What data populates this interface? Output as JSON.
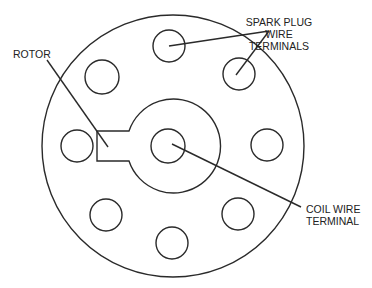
{
  "diagram": {
    "labels": {
      "rotor": "ROTOR",
      "spark_plug_line1": "SPARK PLUG",
      "spark_plug_line2": "WIRE",
      "spark_plug_line3": "TERMINALS",
      "coil_line1": "COIL WIRE",
      "coil_line2": "TERMINAL"
    },
    "components": {
      "outer_cap": {
        "cx": 173,
        "cy": 146,
        "r": 131
      },
      "inner_ring": {
        "cx": 168,
        "cy": 146,
        "r": 47
      },
      "coil_terminal": {
        "cx": 168,
        "cy": 146,
        "r": 17
      },
      "spark_plug_terminals": [
        {
          "id": "top",
          "cx": 169,
          "cy": 46,
          "r": 16
        },
        {
          "id": "upper-right",
          "cx": 239,
          "cy": 74,
          "r": 16
        },
        {
          "id": "right",
          "cx": 267,
          "cy": 145,
          "r": 16
        },
        {
          "id": "lower-right",
          "cx": 238,
          "cy": 214,
          "r": 16
        },
        {
          "id": "bottom",
          "cx": 172,
          "cy": 243,
          "r": 16
        },
        {
          "id": "lower-left",
          "cx": 106,
          "cy": 215,
          "r": 16
        },
        {
          "id": "left",
          "cx": 77,
          "cy": 146,
          "r": 16
        },
        {
          "id": "upper-left",
          "cx": 102,
          "cy": 77,
          "r": 17
        }
      ]
    },
    "colors": {
      "line": "#2a2a2a",
      "text": "#222222",
      "background": "#ffffff"
    }
  }
}
